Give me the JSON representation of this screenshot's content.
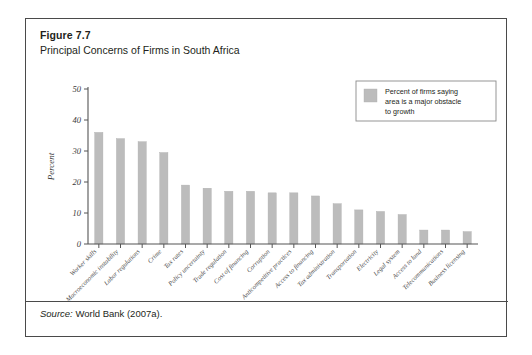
{
  "figure": {
    "number": "Figure 7.7",
    "title": "Principal Concerns of Firms in South Africa",
    "source_label": "Source:",
    "source_text": " World Bank (2007a)."
  },
  "legend": {
    "line1": "Percent of firms saying",
    "line2": "area is a major obstacle",
    "line3": "to growth",
    "swatch_color": "#bcbcbc"
  },
  "chart_data": {
    "type": "bar",
    "title": "Principal Concerns of Firms in South Africa",
    "xlabel": "",
    "ylabel": "Percent",
    "ylim": [
      0,
      50
    ],
    "yticks": [
      0,
      10,
      20,
      30,
      40,
      50
    ],
    "grid": false,
    "legend_position": "top-right",
    "series_name": "Percent of firms saying area is a major obstacle to growth",
    "categories": [
      "Worker skills",
      "Macroeconomic instability",
      "Labor regulations",
      "Crime",
      "Tax rates",
      "Policy uncertainty",
      "Trade regulation",
      "Cost of financing",
      "Corruption",
      "Anticompetitive practices",
      "Access to financing",
      "Tax administration",
      "Transportation",
      "Electricity",
      "Legal system",
      "Access to land",
      "Telecommunications",
      "Business licensing"
    ],
    "values": [
      36,
      34,
      33,
      29.5,
      19,
      18,
      17,
      17,
      16.5,
      16.5,
      15.5,
      13,
      11,
      10.5,
      9.5,
      4.5,
      4.5,
      4
    ]
  }
}
